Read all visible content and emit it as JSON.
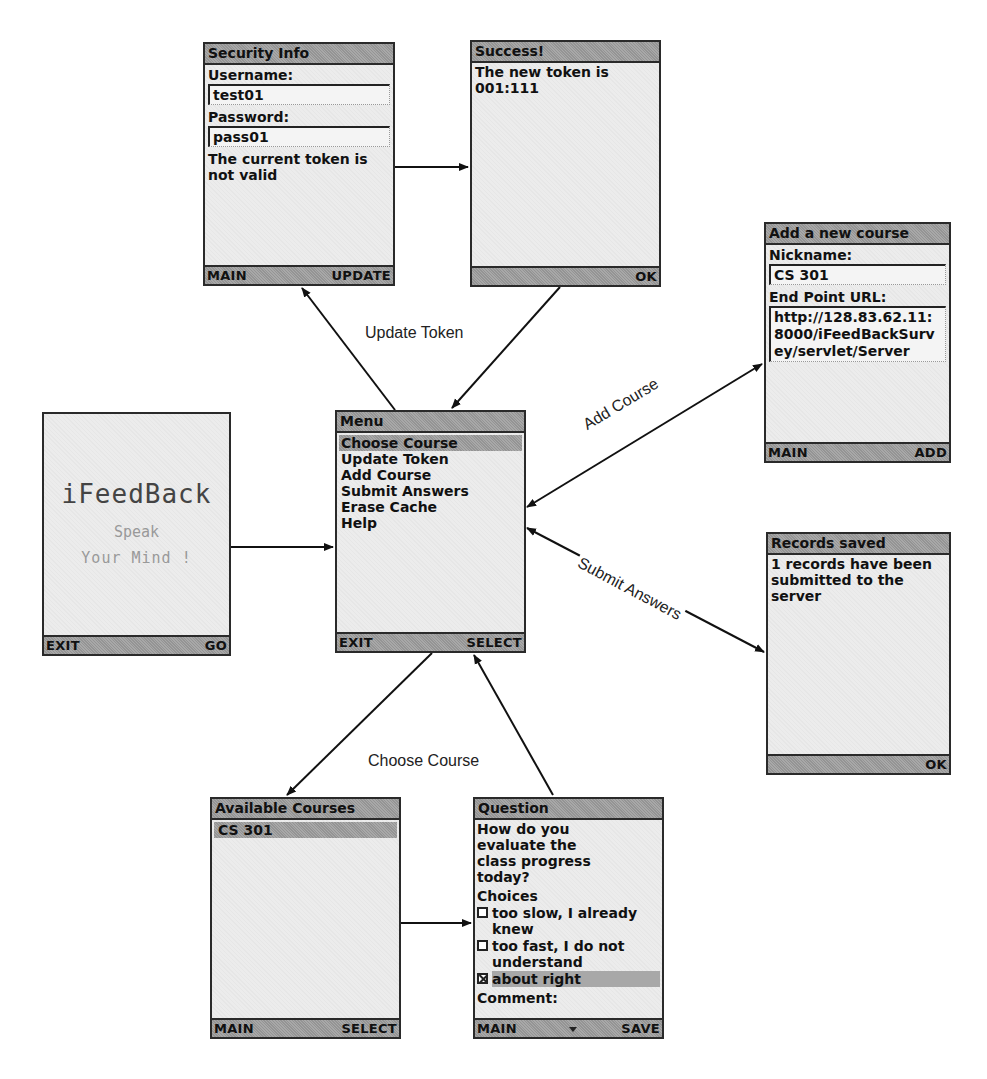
{
  "screens": {
    "security_info": {
      "title": "Security Info",
      "username_label": "Username:",
      "username_value": "test01",
      "password_label": "Password:",
      "password_value": "pass01",
      "message": "The current token is not valid",
      "left_softkey": "MAIN",
      "right_softkey": "UPDATE"
    },
    "success": {
      "title": "Success!",
      "message": "The new token is 001:111",
      "right_softkey": "OK"
    },
    "add_course": {
      "title": "Add a new course",
      "nickname_label": "Nickname:",
      "nickname_value": "CS 301",
      "url_label": "End Point URL:",
      "url_value": "http://128.83.62.11:8000/iFeedBackSurvey/servlet/Server",
      "left_softkey": "MAIN",
      "right_softkey": "ADD"
    },
    "splash": {
      "app_name": "iFeedBack",
      "tagline_1": "Speak",
      "tagline_2": "Your Mind !",
      "left_softkey": "EXIT",
      "right_softkey": "GO"
    },
    "menu": {
      "title": "Menu",
      "items": [
        {
          "label": "Choose Course",
          "selected": true
        },
        {
          "label": "Update Token",
          "selected": false
        },
        {
          "label": "Add Course",
          "selected": false
        },
        {
          "label": "Submit Answers",
          "selected": false
        },
        {
          "label": "Erase Cache",
          "selected": false
        },
        {
          "label": "Help",
          "selected": false
        }
      ],
      "left_softkey": "EXIT",
      "right_softkey": "SELECT"
    },
    "records_saved": {
      "title": "Records saved",
      "message": "1 records have been submitted to the server",
      "right_softkey": "OK"
    },
    "available_courses": {
      "title": "Available Courses",
      "items": [
        {
          "label": "CS 301",
          "selected": true
        }
      ],
      "left_softkey": "MAIN",
      "right_softkey": "SELECT"
    },
    "question": {
      "title": "Question",
      "prompt": "How do you evaluate the class progress today?",
      "choices_label": "Choices",
      "choices": [
        {
          "label": "too slow, I already knew",
          "checked": false
        },
        {
          "label": "too fast, I do not understand",
          "checked": false
        },
        {
          "label": "about right",
          "checked": true
        }
      ],
      "comment_label": "Comment:",
      "left_softkey": "MAIN",
      "right_softkey": "SAVE"
    }
  },
  "edges": {
    "update_token": "Update Token",
    "add_course": "Add Course",
    "submit_answers": "Submit Answers",
    "choose_course": "Choose Course"
  }
}
